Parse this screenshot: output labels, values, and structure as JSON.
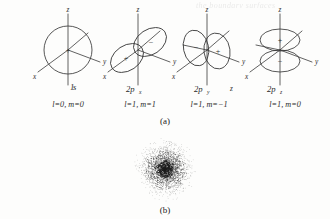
{
  "figure": {
    "background": "#fdfdfc",
    "ink": "#3a3a3a",
    "ghost_text": "the boundary surfaces",
    "panels": [
      {
        "id": "panel-a",
        "caption": "(a)",
        "orbitals": [
          {
            "name": "1s-orbital",
            "label": "1",
            "label_sub": "s",
            "quantum_numbers": "l=0, m=0",
            "shape": "sphere",
            "axes": [
              "z",
              "y",
              "x"
            ],
            "lobes": [
              {
                "sign": "+",
                "position": "center"
              }
            ]
          },
          {
            "name": "2px-orbital",
            "label": "2p",
            "label_sub": "x",
            "quantum_numbers": "l=1, m=1",
            "shape": "dumbbell-tilted-x",
            "axes": [
              "z",
              "y",
              "x"
            ],
            "lobes": [
              {
                "sign": "+",
                "position": "lower-left"
              },
              {
                "sign": "−",
                "position": "upper-right"
              }
            ]
          },
          {
            "name": "2py-orbital",
            "label": "2p",
            "label_sub": "y",
            "quantum_numbers": "l=1, m=−1",
            "shape": "dumbbell-horizontal-y",
            "axes": [
              "z",
              "y",
              "x"
            ],
            "stray_axis_label": "z",
            "lobes": [
              {
                "sign": "−",
                "position": "left"
              },
              {
                "sign": "+",
                "position": "right"
              }
            ]
          },
          {
            "name": "2pz-orbital",
            "label": "2p",
            "label_sub": "z",
            "quantum_numbers": "l=1, m=0",
            "shape": "dumbbell-vertical-z",
            "axes": [
              "z",
              "y",
              "x"
            ],
            "lobes": [
              {
                "sign": "+",
                "position": "top"
              },
              {
                "sign": "−",
                "position": "bottom"
              }
            ]
          }
        ]
      },
      {
        "id": "panel-b",
        "caption": "(b)",
        "plot": {
          "name": "electron-probability-cloud",
          "type": "scatter",
          "description": "dot-density electron probability cloud",
          "dot_count": 2600,
          "dot_color": "#1c1c1c",
          "center": [
            39,
            33
          ],
          "radius": 32
        }
      }
    ]
  },
  "chart_data": {
    "type": "scatter",
    "title": "",
    "xlabel": "",
    "ylabel": "",
    "n_points": 2600,
    "center_x": 0,
    "center_y": 0,
    "max_radius": 32,
    "radial_density_profile": [
      {
        "r": 0,
        "density": 1.0
      },
      {
        "r": 4,
        "density": 0.88
      },
      {
        "r": 8,
        "density": 0.62
      },
      {
        "r": 12,
        "density": 0.42
      },
      {
        "r": 16,
        "density": 0.27
      },
      {
        "r": 20,
        "density": 0.16
      },
      {
        "r": 24,
        "density": 0.09
      },
      {
        "r": 28,
        "density": 0.04
      },
      {
        "r": 32,
        "density": 0.01
      }
    ],
    "grid": false,
    "legend": false
  }
}
